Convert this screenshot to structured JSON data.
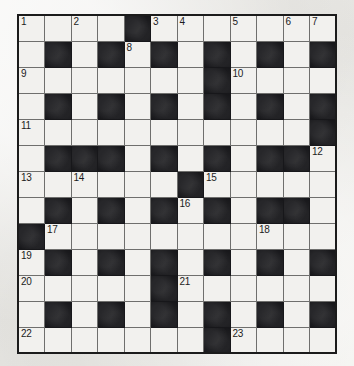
{
  "puzzle": {
    "type": "crossword-grid",
    "rows": 13,
    "cols": 12,
    "colors": {
      "paper": "#eeeeec",
      "cell": "#f2f1ee",
      "block": "#17171a",
      "cell_border": "#6f6f6d",
      "outer_border": "#1b1b1b",
      "number_text": "#1c1c1c"
    },
    "grid": [
      [
        {
          "block": false,
          "num": "1"
        },
        {
          "block": false,
          "num": ""
        },
        {
          "block": false,
          "num": "2"
        },
        {
          "block": false,
          "num": ""
        },
        {
          "block": true,
          "num": ""
        },
        {
          "block": false,
          "num": "3"
        },
        {
          "block": false,
          "num": "4"
        },
        {
          "block": false,
          "num": ""
        },
        {
          "block": false,
          "num": "5"
        },
        {
          "block": false,
          "num": ""
        },
        {
          "block": false,
          "num": "6"
        },
        {
          "block": false,
          "num": "7"
        }
      ],
      [
        {
          "block": false,
          "num": ""
        },
        {
          "block": true,
          "num": ""
        },
        {
          "block": false,
          "num": ""
        },
        {
          "block": true,
          "num": ""
        },
        {
          "block": false,
          "num": "8"
        },
        {
          "block": true,
          "num": ""
        },
        {
          "block": false,
          "num": ""
        },
        {
          "block": true,
          "num": ""
        },
        {
          "block": false,
          "num": ""
        },
        {
          "block": true,
          "num": ""
        },
        {
          "block": false,
          "num": ""
        },
        {
          "block": true,
          "num": ""
        }
      ],
      [
        {
          "block": false,
          "num": "9"
        },
        {
          "block": false,
          "num": ""
        },
        {
          "block": false,
          "num": ""
        },
        {
          "block": false,
          "num": ""
        },
        {
          "block": false,
          "num": ""
        },
        {
          "block": false,
          "num": ""
        },
        {
          "block": false,
          "num": ""
        },
        {
          "block": true,
          "num": ""
        },
        {
          "block": false,
          "num": "10"
        },
        {
          "block": false,
          "num": ""
        },
        {
          "block": false,
          "num": ""
        },
        {
          "block": false,
          "num": ""
        }
      ],
      [
        {
          "block": false,
          "num": ""
        },
        {
          "block": true,
          "num": ""
        },
        {
          "block": false,
          "num": ""
        },
        {
          "block": true,
          "num": ""
        },
        {
          "block": false,
          "num": ""
        },
        {
          "block": true,
          "num": ""
        },
        {
          "block": false,
          "num": ""
        },
        {
          "block": true,
          "num": ""
        },
        {
          "block": false,
          "num": ""
        },
        {
          "block": true,
          "num": ""
        },
        {
          "block": false,
          "num": ""
        },
        {
          "block": true,
          "num": ""
        }
      ],
      [
        {
          "block": false,
          "num": "11"
        },
        {
          "block": false,
          "num": ""
        },
        {
          "block": false,
          "num": ""
        },
        {
          "block": false,
          "num": ""
        },
        {
          "block": false,
          "num": ""
        },
        {
          "block": false,
          "num": ""
        },
        {
          "block": false,
          "num": ""
        },
        {
          "block": false,
          "num": ""
        },
        {
          "block": false,
          "num": ""
        },
        {
          "block": false,
          "num": ""
        },
        {
          "block": false,
          "num": ""
        },
        {
          "block": true,
          "num": ""
        }
      ],
      [
        {
          "block": false,
          "num": ""
        },
        {
          "block": true,
          "num": ""
        },
        {
          "block": true,
          "num": ""
        },
        {
          "block": true,
          "num": ""
        },
        {
          "block": false,
          "num": ""
        },
        {
          "block": true,
          "num": ""
        },
        {
          "block": false,
          "num": ""
        },
        {
          "block": true,
          "num": ""
        },
        {
          "block": false,
          "num": ""
        },
        {
          "block": true,
          "num": ""
        },
        {
          "block": true,
          "num": ""
        },
        {
          "block": false,
          "num": "12"
        }
      ],
      [
        {
          "block": false,
          "num": "13"
        },
        {
          "block": false,
          "num": ""
        },
        {
          "block": false,
          "num": "14"
        },
        {
          "block": false,
          "num": ""
        },
        {
          "block": false,
          "num": ""
        },
        {
          "block": false,
          "num": ""
        },
        {
          "block": true,
          "num": ""
        },
        {
          "block": false,
          "num": "15"
        },
        {
          "block": false,
          "num": ""
        },
        {
          "block": false,
          "num": ""
        },
        {
          "block": false,
          "num": ""
        },
        {
          "block": false,
          "num": ""
        }
      ],
      [
        {
          "block": false,
          "num": ""
        },
        {
          "block": true,
          "num": ""
        },
        {
          "block": false,
          "num": ""
        },
        {
          "block": true,
          "num": ""
        },
        {
          "block": false,
          "num": ""
        },
        {
          "block": true,
          "num": ""
        },
        {
          "block": false,
          "num": "16"
        },
        {
          "block": true,
          "num": ""
        },
        {
          "block": false,
          "num": ""
        },
        {
          "block": true,
          "num": ""
        },
        {
          "block": true,
          "num": ""
        },
        {
          "block": false,
          "num": ""
        }
      ],
      [
        {
          "block": true,
          "num": ""
        },
        {
          "block": false,
          "num": "17"
        },
        {
          "block": false,
          "num": ""
        },
        {
          "block": false,
          "num": ""
        },
        {
          "block": false,
          "num": ""
        },
        {
          "block": false,
          "num": ""
        },
        {
          "block": false,
          "num": ""
        },
        {
          "block": false,
          "num": ""
        },
        {
          "block": false,
          "num": ""
        },
        {
          "block": false,
          "num": "18"
        },
        {
          "block": false,
          "num": ""
        },
        {
          "block": false,
          "num": ""
        }
      ],
      [
        {
          "block": false,
          "num": "19"
        },
        {
          "block": true,
          "num": ""
        },
        {
          "block": false,
          "num": ""
        },
        {
          "block": true,
          "num": ""
        },
        {
          "block": false,
          "num": ""
        },
        {
          "block": true,
          "num": ""
        },
        {
          "block": false,
          "num": ""
        },
        {
          "block": true,
          "num": ""
        },
        {
          "block": false,
          "num": ""
        },
        {
          "block": true,
          "num": ""
        },
        {
          "block": false,
          "num": ""
        },
        {
          "block": true,
          "num": ""
        }
      ],
      [
        {
          "block": false,
          "num": "20"
        },
        {
          "block": false,
          "num": ""
        },
        {
          "block": false,
          "num": ""
        },
        {
          "block": false,
          "num": ""
        },
        {
          "block": false,
          "num": ""
        },
        {
          "block": true,
          "num": ""
        },
        {
          "block": false,
          "num": "21"
        },
        {
          "block": false,
          "num": ""
        },
        {
          "block": false,
          "num": ""
        },
        {
          "block": false,
          "num": ""
        },
        {
          "block": false,
          "num": ""
        },
        {
          "block": false,
          "num": ""
        }
      ],
      [
        {
          "block": false,
          "num": ""
        },
        {
          "block": true,
          "num": ""
        },
        {
          "block": false,
          "num": ""
        },
        {
          "block": true,
          "num": ""
        },
        {
          "block": false,
          "num": ""
        },
        {
          "block": true,
          "num": ""
        },
        {
          "block": false,
          "num": ""
        },
        {
          "block": true,
          "num": ""
        },
        {
          "block": false,
          "num": ""
        },
        {
          "block": true,
          "num": ""
        },
        {
          "block": false,
          "num": ""
        },
        {
          "block": true,
          "num": ""
        }
      ],
      [
        {
          "block": false,
          "num": "22"
        },
        {
          "block": false,
          "num": ""
        },
        {
          "block": false,
          "num": ""
        },
        {
          "block": false,
          "num": ""
        },
        {
          "block": false,
          "num": ""
        },
        {
          "block": false,
          "num": ""
        },
        {
          "block": false,
          "num": ""
        },
        {
          "block": true,
          "num": ""
        },
        {
          "block": false,
          "num": "23"
        },
        {
          "block": false,
          "num": ""
        },
        {
          "block": false,
          "num": ""
        },
        {
          "block": false,
          "num": ""
        }
      ]
    ],
    "clue_numbers": [
      "1",
      "2",
      "3",
      "4",
      "5",
      "6",
      "7",
      "8",
      "9",
      "10",
      "11",
      "12",
      "13",
      "14",
      "15",
      "16",
      "17",
      "18",
      "19",
      "20",
      "21",
      "22",
      "23"
    ]
  }
}
